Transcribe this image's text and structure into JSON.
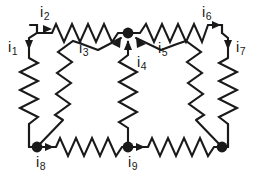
{
  "figure": {
    "type": "circuit-diagram",
    "width": 257,
    "height": 182,
    "background_color": "#ffffff",
    "line_color": "#1a1a1a"
  },
  "labels": {
    "i1": {
      "symbol": "i",
      "subscript": "1",
      "x": 8,
      "y": 46
    },
    "i2": {
      "symbol": "i",
      "subscript": "2",
      "x": 40,
      "y": 10
    },
    "i3": {
      "symbol": "i",
      "subscript": "3",
      "x": 80,
      "y": 47
    },
    "i4": {
      "symbol": "i",
      "subscript": "4",
      "x": 138,
      "y": 60
    },
    "i5": {
      "symbol": "i",
      "subscript": "5",
      "x": 158,
      "y": 47
    },
    "i6": {
      "symbol": "i",
      "subscript": "6",
      "x": 202,
      "y": 10
    },
    "i7": {
      "symbol": "i",
      "subscript": "7",
      "x": 236,
      "y": 46
    },
    "i8": {
      "symbol": "i",
      "subscript": "8",
      "x": 38,
      "y": 155
    },
    "i9": {
      "symbol": "i",
      "subscript": "9",
      "x": 130,
      "y": 155
    }
  },
  "branches": [
    {
      "id": "i1",
      "label": "i1",
      "orientation": "vertical-left",
      "from": "top-left-corner",
      "to": "node-bottom-left",
      "arrow": "down"
    },
    {
      "id": "i2",
      "label": "i2",
      "orientation": "horizontal-top-left",
      "from": "top-left-corner",
      "to": "node-top-center",
      "arrow": "right"
    },
    {
      "id": "i3",
      "label": "i3",
      "orientation": "diagonal",
      "from": "node-bottom-left",
      "to": "node-top-center",
      "arrow": "up-right"
    },
    {
      "id": "i4",
      "label": "i4",
      "orientation": "vertical-center",
      "from": "node-bottom-center",
      "to": "node-top-center",
      "arrow": "up"
    },
    {
      "id": "i5",
      "label": "i5",
      "orientation": "diagonal",
      "from": "node-bottom-right",
      "to": "node-top-center",
      "arrow": "up-left"
    },
    {
      "id": "i6",
      "label": "i6",
      "orientation": "horizontal-top-right",
      "from": "node-top-center",
      "to": "top-right-corner",
      "arrow": "right"
    },
    {
      "id": "i7",
      "label": "i7",
      "orientation": "vertical-right",
      "from": "top-right-corner",
      "to": "node-bottom-right",
      "arrow": "down"
    },
    {
      "id": "i8",
      "label": "i8",
      "orientation": "horizontal-bottom-left",
      "from": "node-bottom-left",
      "to": "node-bottom-center",
      "arrow": "right"
    },
    {
      "id": "i9",
      "label": "i9",
      "orientation": "horizontal-bottom-right",
      "from": "node-bottom-center",
      "to": "node-bottom-right",
      "arrow": "right"
    }
  ],
  "nodes": [
    {
      "id": "node-top-center",
      "x": 128,
      "y": 33,
      "filled": true
    },
    {
      "id": "node-bottom-left",
      "x": 37,
      "y": 147,
      "filled": true
    },
    {
      "id": "node-bottom-center",
      "x": 128,
      "y": 147,
      "filled": true
    },
    {
      "id": "node-bottom-right",
      "x": 222,
      "y": 147,
      "filled": true
    }
  ]
}
